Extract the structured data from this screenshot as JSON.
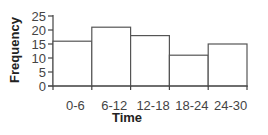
{
  "chart_data": {
    "type": "bar",
    "subtype": "histogram",
    "title": "",
    "xlabel": "Time",
    "ylabel": "Frequency",
    "categories": [
      "0-6",
      "6-12",
      "12-18",
      "18-24",
      "24-30"
    ],
    "values": [
      16,
      21,
      18,
      11,
      15
    ],
    "ylim": [
      0,
      25
    ],
    "yticks": [
      0,
      5,
      10,
      15,
      20,
      25
    ],
    "grid": false,
    "legend": null,
    "bar_fill": "#ffffff",
    "bar_stroke": "#555555",
    "axis_color": "#444444"
  }
}
